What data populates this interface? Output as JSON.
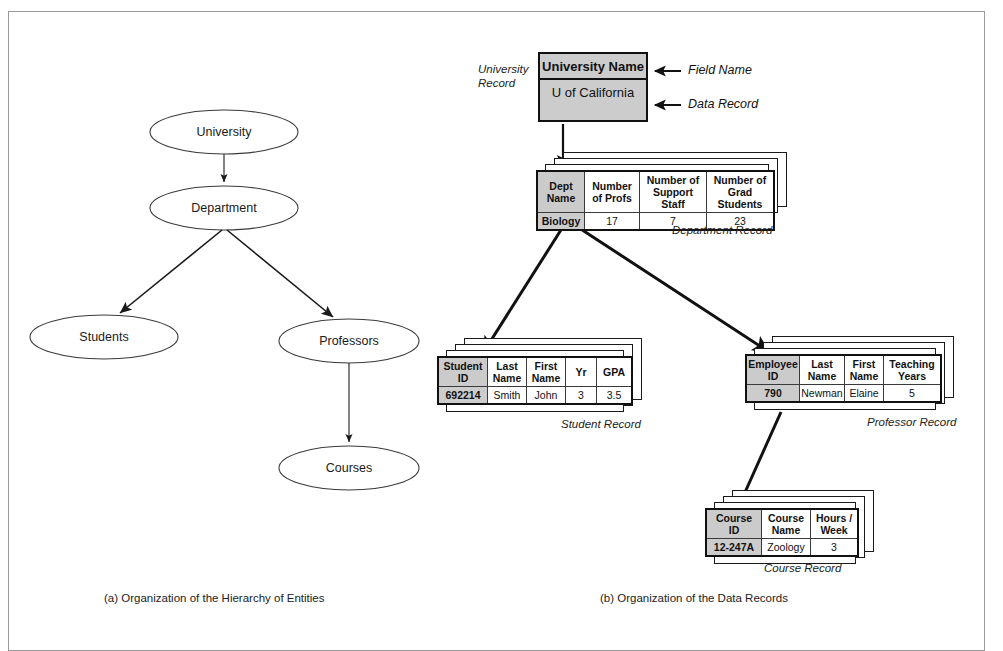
{
  "figure": {
    "panel_a_caption": "(a)  Organization of the Hierarchy of Entities",
    "panel_b_caption": "(b) Organization of the Data Records"
  },
  "hierarchy": {
    "nodes": [
      {
        "id": "university",
        "label": "University"
      },
      {
        "id": "department",
        "label": "Department"
      },
      {
        "id": "students",
        "label": "Students"
      },
      {
        "id": "professors",
        "label": "Professors"
      },
      {
        "id": "courses",
        "label": "Courses"
      }
    ],
    "edges": [
      {
        "from": "university",
        "to": "department"
      },
      {
        "from": "department",
        "to": "students"
      },
      {
        "from": "department",
        "to": "professors"
      },
      {
        "from": "professors",
        "to": "courses"
      }
    ]
  },
  "records": {
    "university": {
      "side_label_line1": "University",
      "side_label_line2": "Record",
      "field_name": "University Name",
      "data_value": "U of California",
      "annotation_field": "Field Name",
      "annotation_data": "Data Record"
    },
    "department": {
      "caption": "Department Record",
      "headers": [
        "Dept Name",
        "Number of Profs",
        "Number of Support Staff",
        "Number of Grad Students"
      ],
      "headers_wrapped": [
        [
          "Dept",
          "Name"
        ],
        [
          "Number",
          "of Profs"
        ],
        [
          "Number of",
          "Support Staff"
        ],
        [
          "Number of",
          "Grad Students"
        ]
      ],
      "values": [
        "Biology",
        "17",
        "7",
        "23"
      ]
    },
    "student": {
      "caption": "Student Record",
      "headers": [
        "Student ID",
        "Last Name",
        "First Name",
        "Yr",
        "GPA"
      ],
      "headers_wrapped": [
        [
          "Student",
          "ID"
        ],
        [
          "Last",
          "Name"
        ],
        [
          "First",
          "Name"
        ],
        [
          "Yr",
          ""
        ],
        [
          "GPA",
          ""
        ]
      ],
      "values": [
        "692214",
        "Smith",
        "John",
        "3",
        "3.5"
      ]
    },
    "professor": {
      "caption": "Professor Record",
      "headers": [
        "Employee ID",
        "Last Name",
        "First Name",
        "Teaching Years"
      ],
      "headers_wrapped": [
        [
          "Employee",
          "ID"
        ],
        [
          "Last",
          "Name"
        ],
        [
          "First",
          "Name"
        ],
        [
          "Teaching",
          "Years"
        ]
      ],
      "values": [
        "790",
        "Newman",
        "Elaine",
        "5"
      ]
    },
    "course": {
      "caption": "Course Record",
      "headers": [
        "Course ID",
        "Course Name",
        "Hours / Week"
      ],
      "headers_wrapped": [
        [
          "Course",
          "ID"
        ],
        [
          "Course",
          "Name"
        ],
        [
          "Hours /",
          "Week"
        ]
      ],
      "values": [
        "12-247A",
        "Zoology",
        "3"
      ]
    }
  },
  "colors": {
    "key_cell": "#cccccc",
    "border": "#111111",
    "frame": "#9a9a9a"
  }
}
